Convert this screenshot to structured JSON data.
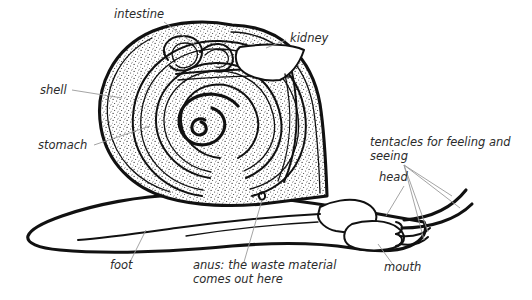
{
  "diagram": {
    "background_color": "#ffffff",
    "ink_color": "#111111",
    "leader_color": "#9a9a9a",
    "label_color": "#2b2b2b",
    "labels": [
      {
        "id": "intestine",
        "text": "intestine",
        "x": 114,
        "y": 18,
        "anchor": "start"
      },
      {
        "id": "kidney",
        "text": "kidney",
        "x": 290,
        "y": 42,
        "anchor": "start"
      },
      {
        "id": "shell",
        "text": "shell",
        "x": 40,
        "y": 94,
        "anchor": "start"
      },
      {
        "id": "stomach",
        "text": "stomach",
        "x": 38,
        "y": 149,
        "anchor": "start"
      },
      {
        "id": "tentacles1",
        "text": "tentacles for feeling and",
        "x": 370,
        "y": 146,
        "anchor": "start"
      },
      {
        "id": "tentacles2",
        "text": "seeing",
        "x": 370,
        "y": 160,
        "anchor": "start"
      },
      {
        "id": "head",
        "text": "head",
        "x": 379,
        "y": 181,
        "anchor": "start"
      },
      {
        "id": "mouth",
        "text": "mouth",
        "x": 384,
        "y": 271,
        "anchor": "start"
      },
      {
        "id": "foot",
        "text": "foot",
        "x": 110,
        "y": 269,
        "anchor": "start"
      },
      {
        "id": "anus1",
        "text": "anus: the waste material",
        "x": 193,
        "y": 269,
        "anchor": "start"
      },
      {
        "id": "anus2",
        "text": "comes out here",
        "x": 193,
        "y": 283,
        "anchor": "start"
      }
    ],
    "parts": [
      {
        "id": "shell",
        "name": "shell"
      },
      {
        "id": "intestine",
        "name": "intestine"
      },
      {
        "id": "kidney",
        "name": "kidney"
      },
      {
        "id": "stomach",
        "name": "stomach"
      },
      {
        "id": "foot",
        "name": "foot"
      },
      {
        "id": "head",
        "name": "head"
      },
      {
        "id": "mouth",
        "name": "mouth"
      },
      {
        "id": "anus",
        "name": "anus"
      },
      {
        "id": "tentacles",
        "name": "tentacles",
        "count": 4
      }
    ]
  }
}
